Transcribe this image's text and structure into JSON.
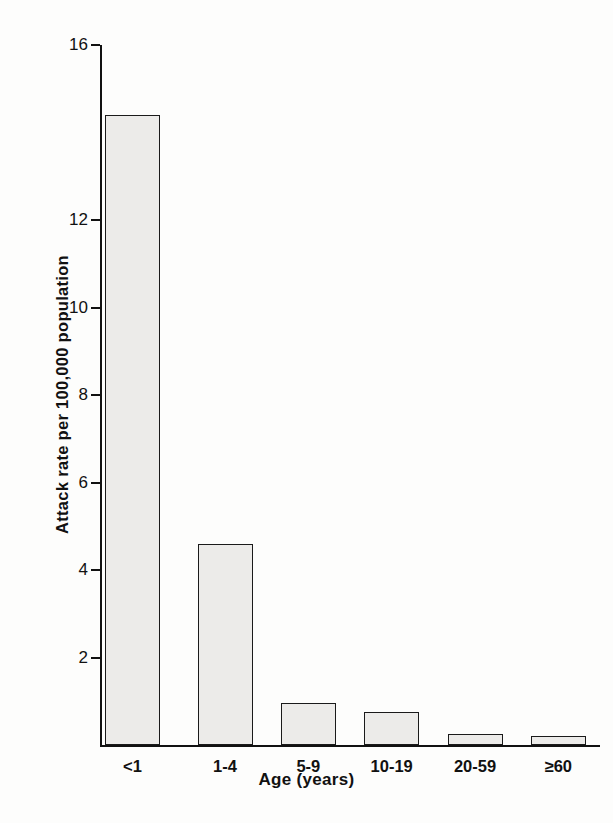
{
  "chart_data": {
    "type": "bar",
    "title": "",
    "xlabel": "Age (years)",
    "ylabel": "Attack rate per 100,000 population",
    "categories": [
      "<1",
      "1-4",
      "5-9",
      "10-19",
      "20-59",
      "≥60"
    ],
    "values": [
      14.4,
      4.6,
      0.95,
      0.75,
      0.25,
      0.2
    ],
    "ylim": [
      0,
      16
    ],
    "yticks": [
      2,
      4,
      6,
      8,
      10,
      12,
      16
    ],
    "ytick_labels": [
      "2",
      "4",
      "6",
      "8",
      "10",
      "12",
      "16"
    ],
    "grid": false,
    "legend": false,
    "bar_fill_color": "#ecebe9",
    "bar_edge_color": "#1a1a1a",
    "background_color": "#ffffff",
    "axis_color": "#111111"
  }
}
